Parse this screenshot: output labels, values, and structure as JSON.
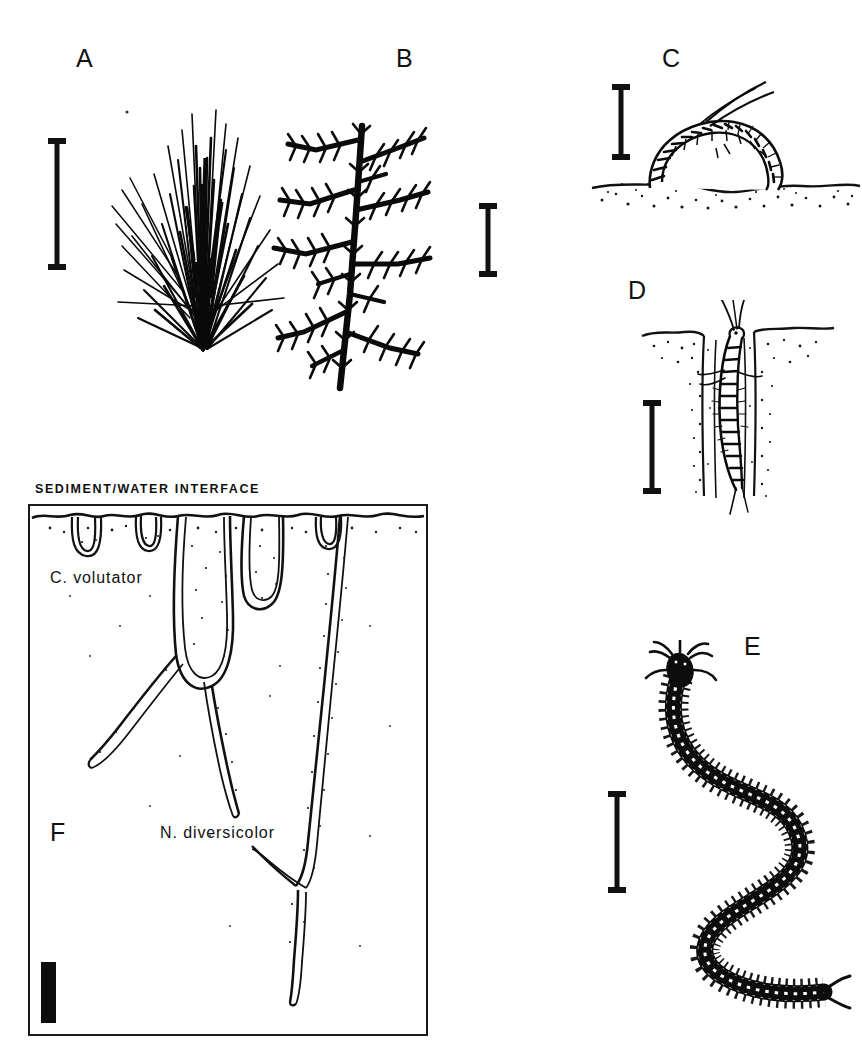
{
  "figure": {
    "background_color": "#ffffff",
    "ink_color": "#000000",
    "width": 862,
    "height": 1047,
    "style": "black-and-white scientific line drawing plate"
  },
  "panels": [
    {
      "id": "A",
      "letter": "A",
      "subject": "tuft of filamentous algae / seagrass blades",
      "icon": "algal-tuft-icon",
      "scale_bar": {
        "orientation": "vertical",
        "style": "i-beam"
      }
    },
    {
      "id": "B",
      "letter": "B",
      "subject": "branching filamentous alga with pinnate side branches",
      "icon": "branching-alga-icon",
      "scale_bar": {
        "orientation": "vertical",
        "style": "i-beam"
      }
    },
    {
      "id": "C",
      "letter": "C",
      "subject": "amphipod Corophium volutator at sediment surface",
      "icon": "amphipod-surface-icon",
      "scale_bar": {
        "orientation": "vertical",
        "style": "i-beam"
      }
    },
    {
      "id": "D",
      "letter": "D",
      "subject": "amphipod Corophium volutator inside U-shaped burrow",
      "icon": "amphipod-in-burrow-icon",
      "scale_bar": {
        "orientation": "vertical",
        "style": "i-beam"
      }
    },
    {
      "id": "E",
      "letter": "E",
      "subject": "polychaete worm Nereis diversicolor, S-shaped body with parapodia",
      "icon": "polychaete-worm-icon",
      "scale_bar": {
        "orientation": "vertical",
        "style": "i-beam"
      }
    },
    {
      "id": "F",
      "letter": "F",
      "subject": "sediment profile cross-section showing burrow systems",
      "icon": "sediment-profile-icon",
      "scale_bar": {
        "orientation": "vertical",
        "style": "solid-block"
      },
      "labels": {
        "interface": "SEDIMENT/WATER  INTERFACE",
        "species_upper": "C. volutator",
        "species_lower": "N. diversicolor"
      }
    }
  ]
}
